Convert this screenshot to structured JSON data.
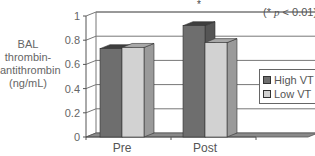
{
  "chart_data": {
    "type": "bar",
    "style": "3d-grouped",
    "title": "",
    "xlabel": "",
    "ylabel": "BAL thrombin-antithrombin (ng/mL)",
    "ylabel_lines": [
      "BAL",
      "thrombin-",
      "antithrombin",
      "(ng/mL)"
    ],
    "categories": [
      "Pre",
      "Post"
    ],
    "series": [
      {
        "name": "High VT",
        "color": "#6e6e6e",
        "values": [
          0.73,
          0.92
        ]
      },
      {
        "name": "Low VT",
        "color": "#d2d2d2",
        "values": [
          0.74,
          0.78
        ]
      }
    ],
    "ylim": [
      0,
      1
    ],
    "yticks": [
      0,
      0.2,
      0.4,
      0.6,
      0.8,
      1
    ],
    "ytick_labels": [
      "0",
      "0.2",
      "0.4",
      "0.6",
      "0.8",
      "1"
    ],
    "grid": true,
    "legend_position": "right",
    "annotations": [
      {
        "text": "*",
        "category": "Post",
        "meaning": "significant"
      },
      {
        "text": "(* p < 0.01)",
        "position": "top-right"
      }
    ]
  },
  "note": {
    "prefix": "(* ",
    "p": "p",
    "suffix": " < 0.01)"
  },
  "legend": [
    "High VT",
    "Low VT"
  ]
}
